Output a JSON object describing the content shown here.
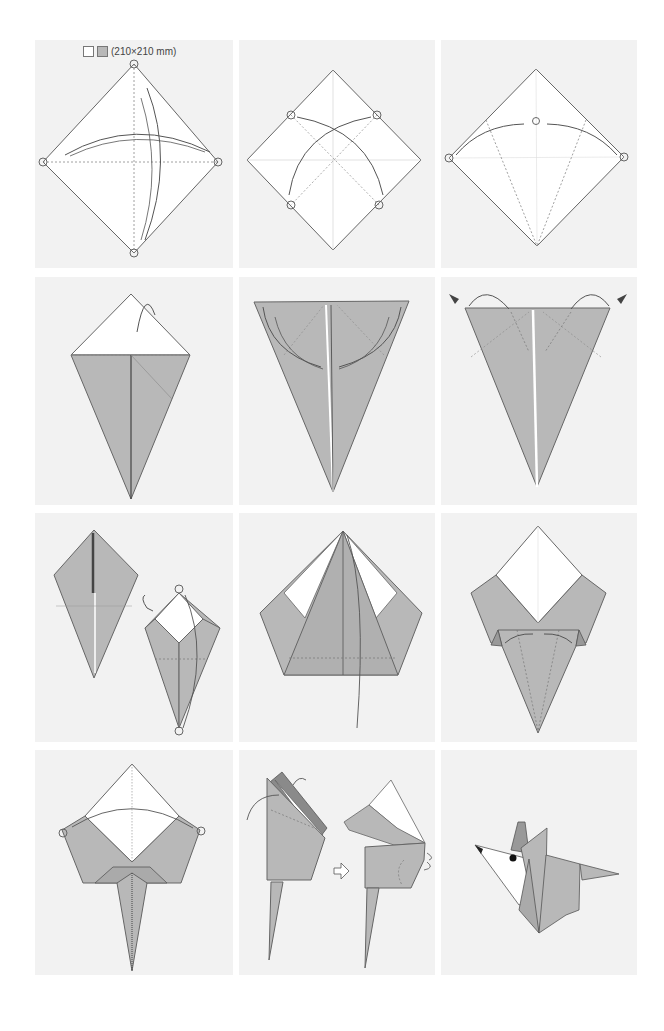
{
  "diagram": {
    "paper": {
      "size_label": "(210×210 mm)",
      "front_color": "#ffffff",
      "back_color": "#b8b8b8"
    },
    "colors": {
      "panel_bg": "#f2f2f2",
      "page_bg": "#ffffff",
      "paper_white": "#ffffff",
      "paper_gray": "#b8b8b8",
      "paper_dark": "#8a8a8a",
      "line": "#555555"
    },
    "grid": {
      "rows": 4,
      "columns": 3
    },
    "steps": [
      {
        "id": 1,
        "description": "Square diamond with both diagonals as valley folds; fold and unfold",
        "symbols": [
          "circle-markers",
          "curved-arrows",
          "dashed-valley-lines"
        ]
      },
      {
        "id": 2,
        "description": "Fold edges to center diagonals, crossing arrows",
        "symbols": [
          "circle-markers",
          "curved-arrows",
          "dashed-lines"
        ]
      },
      {
        "id": 3,
        "description": "Fold side corners to the center point (kite fold)",
        "symbols": [
          "circle-markers",
          "curved-arrows",
          "dashed-lines"
        ]
      },
      {
        "id": 4,
        "description": "Kite shape, fold top triangle behind",
        "symbols": [
          "mountain-fold-arrow"
        ]
      },
      {
        "id": 5,
        "description": "Inverted triangle, fold inner flaps outward",
        "symbols": [
          "curved-arrows"
        ]
      },
      {
        "id": 6,
        "description": "Squash-fold the top corners",
        "symbols": [
          "push-arrows",
          "curved-arrows",
          "dashed-lines"
        ]
      },
      {
        "id": 7,
        "description": "Turn over and fold top point down",
        "symbols": [
          "turn-over-icon",
          "circle-markers",
          "curved-arrow"
        ]
      },
      {
        "id": 8,
        "description": "Pentagon shape; fold inner point down",
        "symbols": [
          "curved-arrow",
          "dashed-line"
        ]
      },
      {
        "id": 9,
        "description": "Fold the bottom flaps inward",
        "symbols": [
          "curved-arrows",
          "dashed-lines"
        ]
      },
      {
        "id": 10,
        "description": "Fold the sides together (valley fold in half)",
        "symbols": [
          "circle-markers",
          "curved-arrow"
        ]
      },
      {
        "id": 11,
        "description": "Shape the ears and head; outside-reverse fold",
        "symbols": [
          "curved-arrows",
          "next-step-arrow"
        ]
      },
      {
        "id": 12,
        "description": "Completed origami mouse",
        "symbols": [
          "eye-dot"
        ]
      }
    ]
  }
}
